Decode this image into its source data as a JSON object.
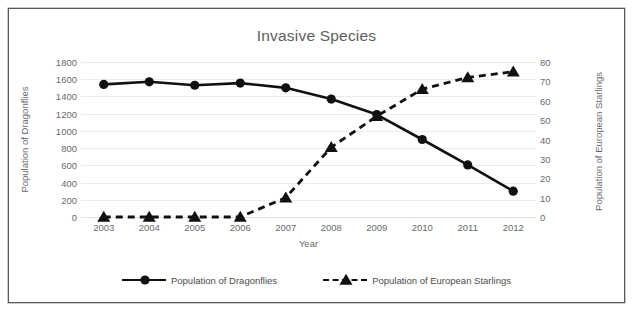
{
  "chart_data": {
    "type": "line",
    "title": "Invasive Species",
    "xlabel": "Year",
    "categories": [
      "2003",
      "2004",
      "2005",
      "2006",
      "2007",
      "2008",
      "2009",
      "2010",
      "2011",
      "2012"
    ],
    "grid": true,
    "legend_position": "bottom",
    "axes": {
      "x": {
        "label": "Year",
        "ticks": [
          "2003",
          "2004",
          "2005",
          "2006",
          "2007",
          "2008",
          "2009",
          "2010",
          "2011",
          "2012"
        ]
      },
      "y_left": {
        "label": "Population of Dragonflies",
        "ticks": [
          "0",
          "200",
          "400",
          "600",
          "800",
          "1000",
          "1200",
          "1400",
          "1600",
          "1800"
        ],
        "lim": [
          0,
          1800
        ]
      },
      "y_right": {
        "label": "Population of European Starlings",
        "ticks": [
          "0",
          "10",
          "20",
          "30",
          "40",
          "50",
          "60",
          "70",
          "80"
        ],
        "lim": [
          0,
          80
        ]
      }
    },
    "series": [
      {
        "name": "Population of Dragonflies",
        "axis": "y_left",
        "marker": "circle",
        "line_style": "solid",
        "color": "#111111",
        "values": [
          1540,
          1570,
          1530,
          1555,
          1500,
          1370,
          1190,
          900,
          605,
          300
        ]
      },
      {
        "name": "Population of European Starlings",
        "axis": "y_right",
        "marker": "triangle",
        "line_style": "dashed",
        "color": "#111111",
        "values": [
          0,
          0,
          0,
          0,
          10,
          36,
          52,
          66,
          72,
          75
        ]
      }
    ],
    "legend": [
      "Population of Dragonflies",
      "Population of European Starlings"
    ]
  }
}
